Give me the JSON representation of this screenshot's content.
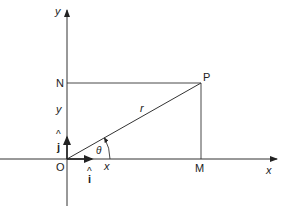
{
  "diagram": {
    "axes": {
      "x_label": "x",
      "y_label": "y"
    },
    "points": {
      "origin": "O",
      "p": "P",
      "m": "M",
      "n": "N"
    },
    "segments": {
      "radius_label": "r",
      "x_component_label": "x",
      "y_component_label": "y"
    },
    "angle": {
      "label": "θ"
    },
    "unit_vectors": {
      "i_hat": "i",
      "j_hat": "j",
      "hat": "^"
    },
    "colors": {
      "line": "#333333",
      "text": "#222222"
    }
  }
}
